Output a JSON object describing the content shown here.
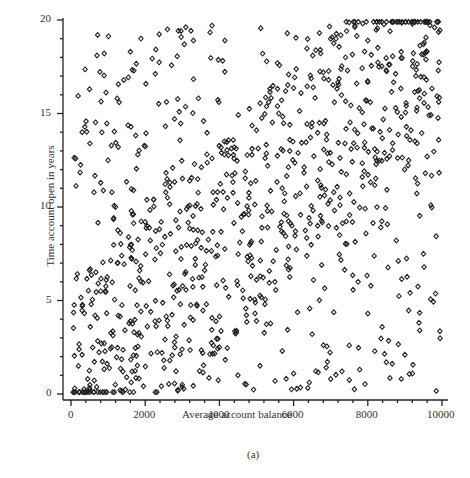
{
  "chart_data": {
    "type": "scatter",
    "title": "",
    "caption": "(a)",
    "xlabel": "Average account balance",
    "ylabel": "Time account open in years",
    "xlim": [
      0,
      10000
    ],
    "ylim": [
      0,
      20
    ],
    "xticks": [
      0,
      2000,
      4000,
      6000,
      8000,
      10000
    ],
    "yticks": [
      0,
      5,
      10,
      15,
      20
    ],
    "xtick_labels": [
      "0",
      "2000",
      "4000",
      "6000",
      "8000",
      "10000"
    ],
    "ytick_labels": [
      "0",
      "5",
      "10",
      "15",
      "20"
    ],
    "grid": false,
    "legend": null,
    "marker": "diamond-open",
    "n_points_approx": 1000,
    "points": [
      [
        100,
        0.3
      ],
      [
        200,
        1.5
      ],
      [
        300,
        2.1
      ],
      [
        450,
        0.8
      ],
      [
        520,
        3.6
      ],
      [
        650,
        4.2
      ],
      [
        800,
        5.5
      ],
      [
        950,
        6.1
      ],
      [
        1100,
        2.5
      ],
      [
        1250,
        7.0
      ],
      [
        1400,
        1.2
      ],
      [
        1550,
        8.4
      ],
      [
        1700,
        3.3
      ],
      [
        1850,
        6.6
      ],
      [
        2000,
        9.2
      ],
      [
        2150,
        4.4
      ],
      [
        2300,
        7.8
      ],
      [
        2450,
        2.2
      ],
      [
        2600,
        10.5
      ],
      [
        2750,
        5.8
      ],
      [
        2900,
        8.9
      ],
      [
        3050,
        3.7
      ],
      [
        3200,
        11.4
      ],
      [
        3350,
        6.9
      ],
      [
        3500,
        9.9
      ],
      [
        3650,
        4.8
      ],
      [
        3800,
        12.6
      ],
      [
        3950,
        7.4
      ],
      [
        4100,
        10.8
      ],
      [
        4250,
        5.2
      ],
      [
        4400,
        13.2
      ],
      [
        4550,
        8.1
      ],
      [
        4700,
        11.9
      ],
      [
        4850,
        6.3
      ],
      [
        5000,
        14.1
      ],
      [
        5150,
        9.5
      ],
      [
        5300,
        12.2
      ],
      [
        5450,
        7.1
      ],
      [
        5600,
        15.0
      ],
      [
        5750,
        10.3
      ],
      [
        5900,
        13.6
      ],
      [
        6050,
        8.7
      ],
      [
        6200,
        16.1
      ],
      [
        6350,
        11.1
      ],
      [
        6500,
        14.5
      ],
      [
        6650,
        9.0
      ],
      [
        6800,
        17.2
      ],
      [
        6950,
        12.4
      ],
      [
        7100,
        15.6
      ],
      [
        7250,
        10.1
      ],
      [
        7400,
        18.0
      ],
      [
        7550,
        13.1
      ],
      [
        7700,
        16.6
      ],
      [
        7850,
        11.6
      ],
      [
        8000,
        18.9
      ],
      [
        8150,
        14.2
      ],
      [
        8300,
        17.5
      ],
      [
        8450,
        12.9
      ],
      [
        8600,
        19.4
      ],
      [
        8750,
        15.3
      ],
      [
        8900,
        18.3
      ],
      [
        9050,
        13.8
      ],
      [
        9200,
        19.8
      ],
      [
        9350,
        16.2
      ],
      [
        9500,
        18.7
      ],
      [
        9650,
        14.9
      ],
      [
        9800,
        19.6
      ],
      [
        9900,
        17.3
      ],
      [
        300,
        14.0
      ],
      [
        500,
        16.3
      ],
      [
        700,
        18.1
      ],
      [
        1000,
        12.5
      ],
      [
        1300,
        15.6
      ],
      [
        1600,
        18.3
      ],
      [
        2600,
        19.5
      ],
      [
        3300,
        18.9
      ],
      [
        3800,
        19.7
      ],
      [
        6000,
        1.1
      ],
      [
        6500,
        3.2
      ],
      [
        7000,
        0.8
      ],
      [
        7500,
        2.6
      ],
      [
        8000,
        4.3
      ],
      [
        8500,
        1.7
      ],
      [
        9000,
        2.1
      ],
      [
        9500,
        7.5
      ],
      [
        9700,
        10.1
      ],
      [
        9400,
        3.4
      ],
      [
        4000,
        2.5
      ],
      [
        4500,
        1.0
      ],
      [
        5000,
        3.9
      ],
      [
        5500,
        0.7
      ],
      [
        3000,
        0.5
      ],
      [
        2500,
        1.8
      ],
      [
        1500,
        0.9
      ],
      [
        800,
        11.3
      ],
      [
        1200,
        10.0
      ],
      [
        1800,
        12.8
      ]
    ]
  }
}
